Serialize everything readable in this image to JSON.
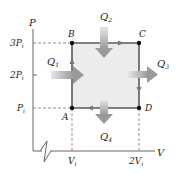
{
  "diagram": {
    "type": "PV cycle",
    "axes": {
      "y_label": "P",
      "x_label": "V",
      "y_ticks": [
        {
          "main": "3P",
          "sub": "i"
        },
        {
          "main": "2P",
          "sub": "i"
        },
        {
          "main": "P",
          "sub": "i"
        }
      ],
      "x_ticks": [
        {
          "main": "V",
          "sub": "i"
        },
        {
          "main": "2V",
          "sub": "i"
        }
      ]
    },
    "points": [
      {
        "name": "A",
        "P": "Pi",
        "V": "Vi"
      },
      {
        "name": "B",
        "P": "3Pi",
        "V": "Vi"
      },
      {
        "name": "C",
        "P": "3Pi",
        "V": "2Vi"
      },
      {
        "name": "D",
        "P": "Pi",
        "V": "2Vi"
      }
    ],
    "path_order": [
      "A",
      "B",
      "C",
      "D",
      "A"
    ],
    "heat_flows": [
      {
        "main": "Q",
        "sub": "1",
        "direction": "in",
        "edge": "AB"
      },
      {
        "main": "Q",
        "sub": "2",
        "direction": "in",
        "edge": "BC"
      },
      {
        "main": "Q",
        "sub": "3",
        "direction": "out",
        "edge": "CD"
      },
      {
        "main": "Q",
        "sub": "4",
        "direction": "out",
        "edge": "DA"
      }
    ],
    "colors": {
      "fill": "#ececec",
      "path": "#5a5a5a",
      "arrow": "#a8a8a8",
      "axis": "#666666",
      "text": "#222222"
    }
  }
}
